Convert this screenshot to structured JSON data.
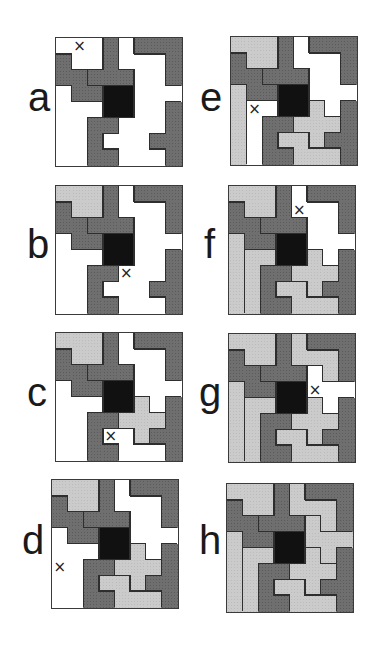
{
  "figure": {
    "grid_size": 8,
    "colors": {
      "dark": "#6f6f6f",
      "light": "#cbcbcb",
      "center": "#111111",
      "empty": "#ffffff",
      "border": "#2e2e2e"
    },
    "center_block": [
      [
        3,
        3
      ],
      [
        4,
        3
      ],
      [
        3,
        4
      ],
      [
        4,
        4
      ]
    ],
    "pieces": {
      "W": {
        "shade": "dark",
        "cells": [
          [
            0,
            1
          ],
          [
            0,
            2
          ],
          [
            1,
            2
          ],
          [
            1,
            3
          ],
          [
            2,
            3
          ]
        ]
      },
      "T": {
        "shade": "dark",
        "cells": [
          [
            3,
            0
          ],
          [
            3,
            1
          ],
          [
            2,
            2
          ],
          [
            3,
            2
          ],
          [
            4,
            2
          ]
        ]
      },
      "V": {
        "shade": "dark",
        "cells": [
          [
            5,
            0
          ],
          [
            6,
            0
          ],
          [
            7,
            0
          ],
          [
            7,
            1
          ],
          [
            7,
            2
          ]
        ]
      },
      "U": {
        "shade": "dark",
        "cells": [
          [
            2,
            5
          ],
          [
            3,
            5
          ],
          [
            2,
            6
          ],
          [
            2,
            7
          ],
          [
            3,
            7
          ]
        ]
      },
      "Y": {
        "shade": "dark",
        "cells": [
          [
            7,
            4
          ],
          [
            7,
            5
          ],
          [
            7,
            6
          ],
          [
            7,
            7
          ],
          [
            6,
            6
          ]
        ]
      },
      "P": {
        "shade": "light",
        "cells": [
          [
            0,
            0
          ],
          [
            1,
            0
          ],
          [
            2,
            0
          ],
          [
            1,
            1
          ],
          [
            2,
            1
          ]
        ]
      },
      "X": {
        "shade": "light",
        "cells": [
          [
            5,
            4
          ],
          [
            4,
            5
          ],
          [
            5,
            5
          ],
          [
            6,
            5
          ],
          [
            5,
            6
          ]
        ]
      },
      "N": {
        "shade": "light",
        "cells": [
          [
            3,
            6
          ],
          [
            4,
            6
          ],
          [
            4,
            7
          ],
          [
            5,
            7
          ],
          [
            6,
            7
          ]
        ]
      },
      "I": {
        "shade": "light",
        "cells": [
          [
            0,
            3
          ],
          [
            0,
            4
          ],
          [
            0,
            5
          ],
          [
            0,
            6
          ],
          [
            0,
            7
          ]
        ]
      },
      "L": {
        "shade": "light",
        "cells": [
          [
            1,
            4
          ],
          [
            2,
            4
          ],
          [
            1,
            5
          ],
          [
            1,
            6
          ],
          [
            1,
            7
          ]
        ]
      },
      "Z": {
        "shade": "light",
        "cells": [
          [
            4,
            0
          ],
          [
            4,
            1
          ],
          [
            5,
            1
          ],
          [
            6,
            1
          ],
          [
            6,
            2
          ]
        ]
      },
      "F": {
        "shade": "light",
        "cells": [
          [
            5,
            2
          ],
          [
            5,
            3
          ],
          [
            6,
            3
          ],
          [
            7,
            3
          ],
          [
            6,
            4
          ]
        ]
      }
    },
    "mark_glyph": "×",
    "panels": [
      {
        "label": "a",
        "x": 55,
        "y": 37,
        "pieces": [
          "W",
          "T",
          "V",
          "U",
          "Y"
        ],
        "mark": [
          1,
          0
        ]
      },
      {
        "label": "b",
        "x": 55,
        "y": 185,
        "pieces": [
          "W",
          "T",
          "V",
          "U",
          "Y",
          "P"
        ],
        "mark": [
          4,
          5
        ]
      },
      {
        "label": "c",
        "x": 55,
        "y": 332,
        "pieces": [
          "W",
          "T",
          "V",
          "U",
          "Y",
          "P",
          "X"
        ],
        "mark": [
          3,
          6
        ]
      },
      {
        "label": "d",
        "x": 51,
        "y": 479,
        "pieces": [
          "W",
          "T",
          "V",
          "U",
          "Y",
          "P",
          "X",
          "N"
        ],
        "mark": [
          0,
          5
        ]
      },
      {
        "label": "e",
        "x": 230,
        "y": 36,
        "pieces": [
          "W",
          "T",
          "V",
          "U",
          "Y",
          "P",
          "X",
          "N",
          "I"
        ],
        "mark": [
          1,
          4
        ]
      },
      {
        "label": "f",
        "x": 228,
        "y": 185,
        "pieces": [
          "W",
          "T",
          "V",
          "U",
          "Y",
          "P",
          "X",
          "N",
          "I",
          "L"
        ],
        "mark": [
          4,
          1
        ]
      },
      {
        "label": "g",
        "x": 228,
        "y": 333,
        "pieces": [
          "W",
          "T",
          "V",
          "U",
          "Y",
          "P",
          "X",
          "N",
          "I",
          "L",
          "Z"
        ],
        "mark": [
          5,
          3
        ]
      },
      {
        "label": "h",
        "x": 226,
        "y": 483,
        "pieces": [
          "W",
          "T",
          "V",
          "U",
          "Y",
          "P",
          "X",
          "N",
          "I",
          "L",
          "Z",
          "F"
        ],
        "mark": null
      }
    ]
  },
  "labels": {
    "a": "a",
    "b": "b",
    "c": "c",
    "d": "d",
    "e": "e",
    "f": "f",
    "g": "g",
    "h": "h"
  }
}
